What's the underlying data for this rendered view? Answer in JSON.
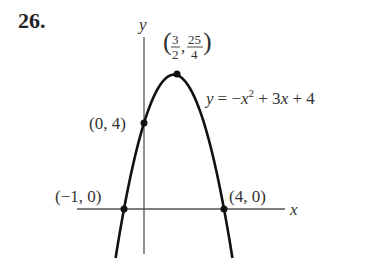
{
  "problem_number": "26.",
  "equation": {
    "lhs": "y",
    "rhs_parts": [
      "= −",
      "x",
      "2",
      " + 3",
      "x",
      " + 4"
    ]
  },
  "axes": {
    "x_label": "x",
    "y_label": "y"
  },
  "points": [
    {
      "label": "(−1, 0)",
      "x": -1,
      "y": 0
    },
    {
      "label": "(0, 4)",
      "x": 0,
      "y": 4
    },
    {
      "label": "(4, 0)",
      "x": 4,
      "y": 0
    },
    {
      "label_num_x": "3",
      "label_den_x": "2",
      "label_num_y": "25",
      "label_den_y": "4",
      "x": 1.5,
      "y": 6.25
    }
  ],
  "chart_data": {
    "type": "line",
    "title": "26.",
    "function": "y = -x^2 + 3x + 4",
    "xlabel": "x",
    "ylabel": "y",
    "series": [
      {
        "name": "y = -x^2 + 3x + 4",
        "x": [
          -1.4,
          -1,
          0,
          1.5,
          3,
          4,
          4.4
        ],
        "values": [
          -2.16,
          0,
          4,
          6.25,
          4,
          0,
          -2.16
        ]
      }
    ],
    "annotations": [
      "(3/2, 25/4)",
      "(0, 4)",
      "(−1, 0)",
      "(4, 0)"
    ],
    "grid": false
  }
}
